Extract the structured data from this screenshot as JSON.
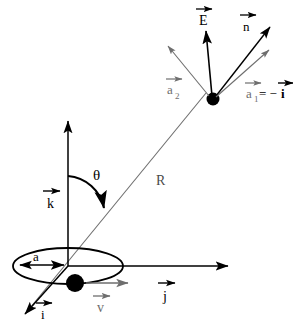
{
  "figure": {
    "background_color": "#ffffff",
    "ink_color": "#000000",
    "gray_color": "#6e6e6e",
    "light_gray_color": "#8a8a8a"
  },
  "labels": {
    "E": "E",
    "n": "n",
    "a2": "a",
    "a2_sub": "2",
    "a1": "a",
    "a1_sub": "1",
    "a1_equals": "= −",
    "a1_rhs": "i",
    "R": "R",
    "theta": "θ",
    "k": "k",
    "a_radius": "a",
    "i": "i",
    "v": "v",
    "j": "j"
  },
  "vectors": [
    {
      "name": "E",
      "label": "E",
      "has_overarrow": true,
      "color": "#000000",
      "origin": "charge",
      "direction": "up-slightly-left"
    },
    {
      "name": "n",
      "label": "n",
      "has_overarrow": true,
      "color": "#000000",
      "origin": "charge",
      "direction": "up-right"
    },
    {
      "name": "a2",
      "label": "a₂",
      "has_overarrow": true,
      "color": "#6e6e6e",
      "origin": "charge",
      "direction": "up-left"
    },
    {
      "name": "a1",
      "label": "a₁ = −i",
      "has_overarrow": true,
      "color": "#6e6e6e",
      "origin": "charge",
      "direction": "up-right-shallow"
    },
    {
      "name": "R",
      "label": "R",
      "has_overarrow": false,
      "color": "#6e6e6e",
      "origin": "origin",
      "direction": "to-charge"
    },
    {
      "name": "k",
      "label": "k",
      "has_overarrow": true,
      "color": "#000000",
      "origin": "origin",
      "direction": "up"
    },
    {
      "name": "j",
      "label": "j",
      "has_overarrow": true,
      "color": "#000000",
      "origin": "origin",
      "direction": "right"
    },
    {
      "name": "i",
      "label": "i",
      "has_overarrow": true,
      "color": "#000000",
      "origin": "origin",
      "direction": "down-left"
    },
    {
      "name": "v",
      "label": "v",
      "has_overarrow": true,
      "color": "#6e6e6e",
      "origin": "particle",
      "direction": "right"
    },
    {
      "name": "a_radius",
      "label": "a",
      "has_overarrow": false,
      "color": "#000000",
      "origin": "ellipse-left",
      "direction": "double-headed-horizontal"
    }
  ],
  "geometry": {
    "origin_point": {
      "x": 68,
      "y": 266
    },
    "charge_point": {
      "x": 213,
      "y": 99
    },
    "particle_point": {
      "x": 75,
      "y": 283
    },
    "orbit_ellipse": {
      "cx": 68,
      "cy": 266,
      "rx": 55,
      "ry": 18
    },
    "angle_arc_label": "θ"
  }
}
